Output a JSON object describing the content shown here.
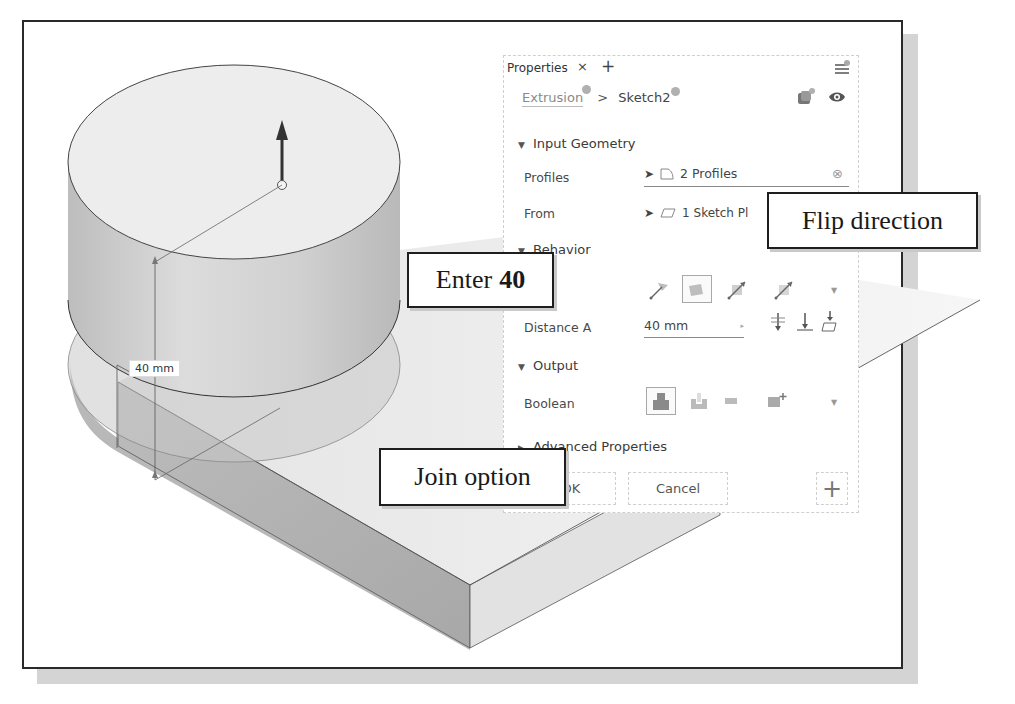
{
  "viewport": {
    "dimension_label": "40 mm"
  },
  "panel": {
    "tab_label": "Properties",
    "tab_close_icon": "×",
    "tab_add_icon": "+",
    "breadcrumb": {
      "parent": "Extrusion",
      "separator": ">",
      "current": "Sketch2"
    },
    "sections": {
      "input_geometry": {
        "title": "Input Geometry",
        "rows": [
          {
            "label": "Profiles",
            "value": "2 Profiles"
          },
          {
            "label": "From",
            "value": "1 Sketch Pl"
          }
        ]
      },
      "behavior": {
        "title": "Behavior",
        "distance_label": "Distance A",
        "distance_value": "40 mm"
      },
      "output": {
        "title": "Output",
        "boolean_label": "Boolean"
      },
      "advanced": {
        "title": "Advanced Properties"
      }
    },
    "buttons": {
      "ok_label": "OK",
      "cancel_label": "Cancel",
      "add_label": "+"
    }
  },
  "callouts": {
    "enter": {
      "prefix": "Enter",
      "value": "40"
    },
    "flip": {
      "text": "Flip direction"
    },
    "join": {
      "text": "Join option"
    }
  },
  "colors": {
    "frame_border": "#2a2a2a",
    "shadow": "#d4d4d4",
    "panel_border": "#cfcfcf",
    "icon_gray": "#9a9a9a",
    "arrow": "#1e1e1e"
  }
}
